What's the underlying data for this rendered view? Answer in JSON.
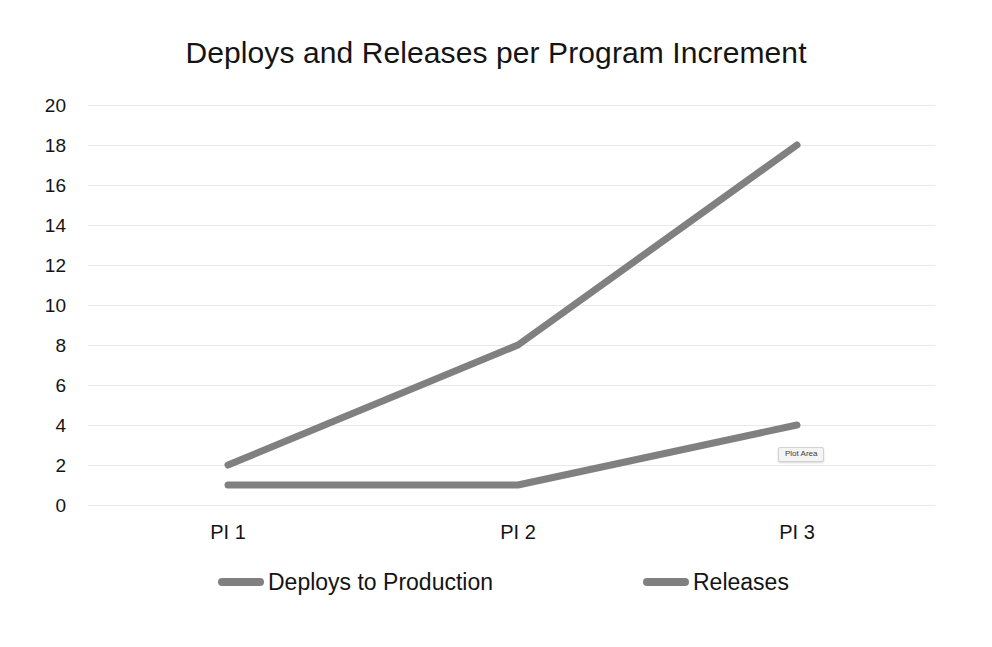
{
  "chart_data": {
    "type": "line",
    "title": "Deploys and Releases per Program Increment",
    "xlabel": "",
    "ylabel": "",
    "categories": [
      "PI 1",
      "PI 2",
      "PI 3"
    ],
    "series": [
      {
        "name": "Deploys to Production",
        "values": [
          2,
          8,
          18
        ],
        "color": "#808080"
      },
      {
        "name": "Releases",
        "values": [
          1,
          1,
          4
        ],
        "color": "#808080"
      }
    ],
    "ylim": [
      0,
      20
    ],
    "ytick_step": 2,
    "yticks": [
      20,
      18,
      16,
      14,
      12,
      10,
      8,
      6,
      4,
      2,
      0
    ],
    "grid": true,
    "grid_axis": "y",
    "grid_color": "#e9e9e9",
    "legend_position": "bottom",
    "background_color": "#ffffff",
    "line_width": 7
  },
  "tooltip": {
    "label": "Plot Area"
  },
  "legend": {
    "items": [
      {
        "label": "Deploys to Production"
      },
      {
        "label": "Releases"
      }
    ]
  }
}
